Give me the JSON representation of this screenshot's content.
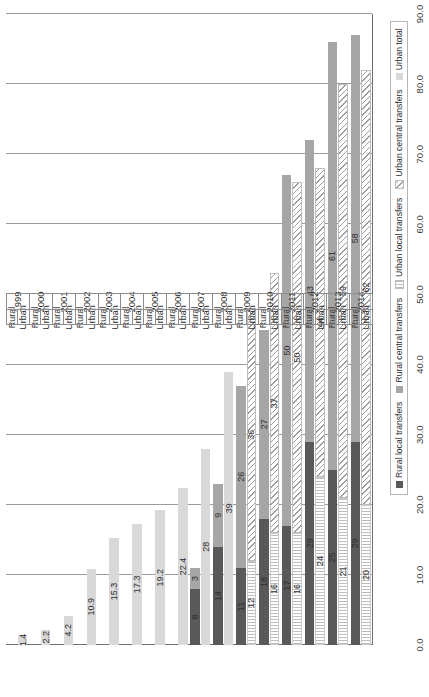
{
  "chart_data": {
    "type": "bar",
    "orientation": "horizontal-rotated",
    "title": "",
    "xlabel": "",
    "ylabel": "",
    "ylim": [
      0,
      90
    ],
    "axis_ticks": [
      "0.0",
      "10.0",
      "20.0",
      "30.0",
      "40.0",
      "50.0",
      "60.0",
      "70.0",
      "80.0",
      "90.0"
    ],
    "tick_values": [
      0,
      10,
      20,
      30,
      40,
      50,
      60,
      70,
      80,
      90
    ],
    "grid": true,
    "legend_position": "bottom-right",
    "categories": [
      "1999",
      "2000",
      "2001",
      "2002",
      "2003",
      "2004",
      "2005",
      "2006",
      "2007",
      "2008",
      "2009",
      "2010",
      "2011",
      "2012",
      "2013",
      "2014"
    ],
    "subcategories": [
      "Urban",
      "Rural"
    ],
    "series": [
      {
        "name": "Rural local transfers",
        "key": "rural_local",
        "color": "#595959"
      },
      {
        "name": "Rural central transfers",
        "key": "rural_central",
        "color": "#a6a6a6"
      },
      {
        "name": "Urban local transfers",
        "key": "urban_local",
        "color": "#ffffff"
      },
      {
        "name": "Urban central transfers",
        "key": "urban_central",
        "color": "#ffffff"
      },
      {
        "name": "Urban total",
        "key": "urban_total",
        "color": "#d9d9d9"
      }
    ],
    "rows": [
      {
        "year": "1999",
        "urban_total": 1.4,
        "urban_total_label": "1.4"
      },
      {
        "year": "2000",
        "urban_total": 2.2,
        "urban_total_label": "2.2"
      },
      {
        "year": "2001",
        "urban_total": 4.2,
        "urban_total_label": "4.2"
      },
      {
        "year": "2002",
        "urban_total": 10.9,
        "urban_total_label": "10.9"
      },
      {
        "year": "2003",
        "urban_total": 15.3,
        "urban_total_label": "15.3"
      },
      {
        "year": "2004",
        "urban_total": 17.3,
        "urban_total_label": "17.3"
      },
      {
        "year": "2005",
        "urban_total": 19.2,
        "urban_total_label": "19.2"
      },
      {
        "year": "2006",
        "urban_total": 22.4,
        "urban_total_label": "22.4"
      },
      {
        "year": "2007",
        "urban_total": 28,
        "urban_total_label": "28",
        "rural_local": 8,
        "rural_local_label": "8",
        "rural_central": 3,
        "rural_central_label": "3"
      },
      {
        "year": "2008",
        "urban_total": 39,
        "urban_total_label": "39",
        "rural_local": 14,
        "rural_local_label": "14",
        "rural_central": 9,
        "rural_central_label": "9"
      },
      {
        "year": "2009",
        "urban_local": 12,
        "urban_local_label": "12",
        "urban_central": 36,
        "urban_central_label": "36",
        "rural_local": 11,
        "rural_local_label": "11",
        "rural_central": 26,
        "rural_central_label": "26"
      },
      {
        "year": "2010",
        "urban_local": 16,
        "urban_local_label": "16",
        "urban_central": 37,
        "urban_central_label": "37",
        "rural_local": 18,
        "rural_local_label": "18",
        "rural_central": 27,
        "rural_central_label": "27"
      },
      {
        "year": "2011",
        "urban_local": 16,
        "urban_local_label": "16",
        "urban_central": 50,
        "urban_central_label": "50",
        "rural_local": 17,
        "rural_local_label": "17",
        "rural_central": 50,
        "rural_central_label": "50"
      },
      {
        "year": "2012",
        "urban_local": 24,
        "urban_local_label": "24",
        "urban_central": 44,
        "urban_central_label": "44",
        "rural_local": 29,
        "rural_local_label": "29",
        "rural_central": 43,
        "rural_central_label": "43"
      },
      {
        "year": "2013",
        "urban_local": 21,
        "urban_local_label": "21",
        "urban_central": 59,
        "urban_central_label": "59",
        "rural_local": 25,
        "rural_local_label": "25",
        "rural_central": 61,
        "rural_central_label": "61"
      },
      {
        "year": "2014",
        "urban_local": 20,
        "urban_local_label": "20",
        "urban_central": 62,
        "urban_central_label": "62",
        "rural_local": 29,
        "rural_local_label": "29",
        "rural_central": 58,
        "rural_central_label": "58"
      }
    ]
  },
  "legend": {
    "items": [
      {
        "label": "Rural  local transfers",
        "style": "rural-local"
      },
      {
        "label": "Rural  central transfers",
        "style": "rural-central"
      },
      {
        "label": "Urban local transfers",
        "style": "urban-local"
      },
      {
        "label": "Urban central transfers",
        "style": "urban-central"
      },
      {
        "label": "Urban total",
        "style": "urban-total"
      }
    ]
  },
  "axis": {
    "category_labels": {
      "rural": "Rural",
      "urban": "Urban"
    }
  }
}
